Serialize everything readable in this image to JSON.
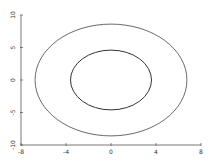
{
  "chart_data": {
    "type": "line",
    "title": "",
    "xlabel": "",
    "ylabel": "",
    "xlim": [
      -8,
      8
    ],
    "ylim": [
      -10,
      10
    ],
    "grid": false,
    "legend": null,
    "xticks": [
      -8,
      -4,
      0,
      4,
      8
    ],
    "xtick_labels": [
      "-8",
      "-4",
      "0",
      "4",
      "8"
    ],
    "yticks": [
      -10,
      -5,
      0,
      5,
      10
    ],
    "ytick_labels": [
      "-10",
      "-5",
      "0",
      "5",
      "10"
    ],
    "series": [
      {
        "name": "outer ellipse",
        "shape": "ellipse",
        "cx": 0,
        "cy": 0,
        "rx": 6.75,
        "ry": 8.6,
        "color": "#444444"
      },
      {
        "name": "inner ellipse",
        "shape": "ellipse",
        "cx": 0,
        "cy": 0,
        "rx": 3.6,
        "ry": 4.6,
        "color": "#333333"
      }
    ]
  },
  "plot": {
    "px_left": 21,
    "px_right": 201,
    "px_top": 15,
    "px_bottom": 145
  }
}
